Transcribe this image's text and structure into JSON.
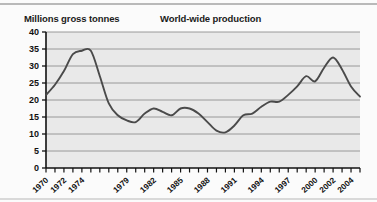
{
  "chart_data": {
    "type": "line",
    "title": "World-wide production",
    "ylabel": "Millions gross tonnes",
    "xlabel": "",
    "ylim": [
      0,
      40
    ],
    "ytick_step": 5,
    "yticks": [
      "0",
      "5",
      "10",
      "15",
      "20",
      "25",
      "30",
      "35",
      "40"
    ],
    "xlim": [
      1970,
      2005
    ],
    "xticks_labeled": [
      "1970",
      "1972",
      "1974",
      "1979",
      "1982",
      "1985",
      "1988",
      "1991",
      "1994",
      "1997",
      "2000",
      "2002",
      "2004"
    ],
    "xtick_every_year": true,
    "grid": "horizontal",
    "legend": "none",
    "line_color": "#4a4a4a",
    "plot_background": "#e9e9e9",
    "x": [
      1970,
      1971,
      1972,
      1973,
      1974,
      1975,
      1976,
      1977,
      1978,
      1979,
      1980,
      1981,
      1982,
      1983,
      1984,
      1985,
      1986,
      1987,
      1988,
      1989,
      1990,
      1991,
      1992,
      1993,
      1994,
      1995,
      1996,
      1997,
      1998,
      1999,
      2000,
      2001,
      2002,
      2003,
      2004,
      2005
    ],
    "values": [
      21.5,
      24.5,
      28.5,
      33.5,
      34.5,
      34.5,
      27.0,
      19.0,
      15.5,
      14.0,
      13.5,
      16.0,
      17.5,
      16.5,
      15.5,
      17.5,
      17.5,
      16.0,
      13.5,
      11.0,
      10.5,
      12.5,
      15.5,
      16.0,
      18.0,
      19.5,
      19.5,
      21.5,
      24.0,
      27.0,
      25.5,
      29.5,
      32.5,
      29.0,
      24.0,
      21.0
    ]
  }
}
